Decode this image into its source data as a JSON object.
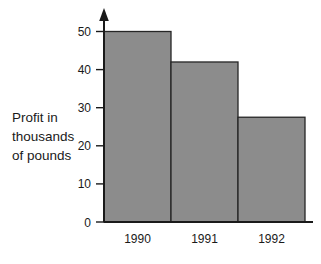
{
  "chart_data": {
    "type": "bar",
    "title": "",
    "subtitle": "",
    "categories": [
      "1990",
      "1991",
      "1992"
    ],
    "values": [
      50,
      42,
      27.5
    ],
    "xlabel": "",
    "ylabel": "Profit in thousands of pounds",
    "ylabel_lines": [
      "Profit in",
      "thousands",
      "of pounds"
    ],
    "ylim": [
      0,
      50
    ],
    "yticks": [
      0,
      10,
      20,
      30,
      40,
      50
    ],
    "ytick_labels": [
      "0",
      "10",
      "20",
      "30",
      "40",
      "50"
    ],
    "grid": false,
    "legend": null,
    "legend_position": "none",
    "bar_fill_color": "#8c8c8c",
    "bar_border_color": "#262626",
    "axis_color": "#1a1a1a",
    "background_color": "#ffffff",
    "y_axis_has_arrow": true,
    "bars_adjacent": true,
    "annotations": []
  }
}
